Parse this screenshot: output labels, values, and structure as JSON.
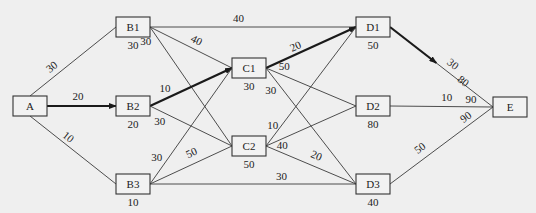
{
  "diagram": {
    "title": "",
    "nodes": [
      {
        "id": "A",
        "label": "A",
        "value": ""
      },
      {
        "id": "B1",
        "label": "B1",
        "value": "30"
      },
      {
        "id": "B2",
        "label": "B2",
        "value": "20"
      },
      {
        "id": "B3",
        "label": "B3",
        "value": "10"
      },
      {
        "id": "C1",
        "label": "C1",
        "value": "30"
      },
      {
        "id": "C2",
        "label": "C2",
        "value": "50"
      },
      {
        "id": "D1",
        "label": "D1",
        "value": "50"
      },
      {
        "id": "D2",
        "label": "D2",
        "value": "80"
      },
      {
        "id": "D3",
        "label": "D3",
        "value": "40"
      },
      {
        "id": "E",
        "label": "E",
        "value": ""
      }
    ],
    "edges": [
      {
        "from": "A",
        "to": "B1",
        "weight": "30",
        "highlight": false
      },
      {
        "from": "A",
        "to": "B2",
        "weight": "20",
        "highlight": true
      },
      {
        "from": "A",
        "to": "B3",
        "weight": "10",
        "highlight": false
      },
      {
        "from": "B1",
        "to": "D1",
        "weight": "40",
        "highlight": false
      },
      {
        "from": "B1",
        "to": "C1",
        "weight": "40",
        "highlight": false
      },
      {
        "from": "B1",
        "to": "C2",
        "weight": "30",
        "highlight": false
      },
      {
        "from": "B2",
        "to": "C1",
        "weight": "10",
        "highlight": true
      },
      {
        "from": "B2",
        "to": "C2",
        "weight": "30",
        "highlight": false
      },
      {
        "from": "B3",
        "to": "C1",
        "weight": "30",
        "highlight": false
      },
      {
        "from": "B3",
        "to": "C2",
        "weight": "50",
        "highlight": false
      },
      {
        "from": "B3",
        "to": "D3",
        "weight": "30",
        "highlight": false
      },
      {
        "from": "C1",
        "to": "D1",
        "weight": "20",
        "highlight": true
      },
      {
        "from": "C1",
        "to": "D2",
        "weight": "50",
        "highlight": false
      },
      {
        "from": "C1",
        "to": "D3",
        "weight": "30",
        "highlight": false
      },
      {
        "from": "C2",
        "to": "D1",
        "weight": "10",
        "highlight": false
      },
      {
        "from": "C2",
        "to": "D2",
        "weight": "40",
        "highlight": false
      },
      {
        "from": "C2",
        "to": "D3",
        "weight": "20",
        "highlight": false
      },
      {
        "from": "D1",
        "to": "E",
        "weight": "30",
        "highlight": true,
        "end_label": "80"
      },
      {
        "from": "D2",
        "to": "E",
        "weight": "10",
        "highlight": false,
        "end_label": "90"
      },
      {
        "from": "D3",
        "to": "E",
        "weight": "50",
        "highlight": false,
        "end_label": "90"
      }
    ]
  }
}
